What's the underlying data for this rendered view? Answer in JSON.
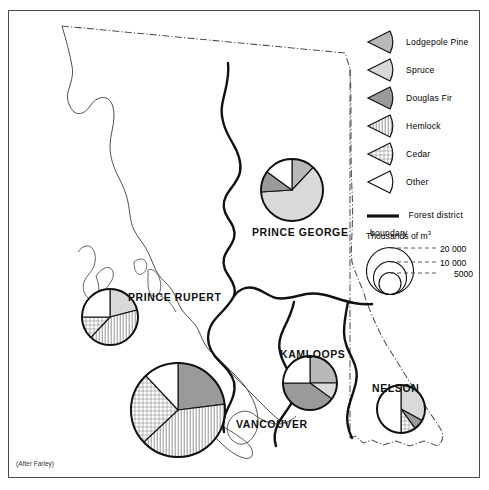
{
  "figure": {
    "credit": "(After Farley)"
  },
  "legend": {
    "species": [
      {
        "name": "Lodgepole Pine",
        "key": "lodgepole",
        "color": "#b9b9b9",
        "pattern": "solid"
      },
      {
        "name": "Spruce",
        "key": "spruce",
        "color": "#d9d9d9",
        "pattern": "solid"
      },
      {
        "name": "Douglas Fir",
        "key": "douglasfir",
        "color": "#9a9a9a",
        "pattern": "solid"
      },
      {
        "name": "Hemlock",
        "key": "hemlock",
        "color": "#ffffff",
        "pattern": "vertical-lines"
      },
      {
        "name": "Cedar",
        "key": "cedar",
        "color": "#ffffff",
        "pattern": "cross-hatch"
      },
      {
        "name": "Other",
        "key": "other",
        "color": "#ffffff",
        "pattern": "none"
      }
    ],
    "boundary_label": "Forest district boundary",
    "scale_title": "Thousands of m",
    "scale_title_sup": "3",
    "scale_values": [
      "20 000",
      "10 000",
      "5000"
    ]
  },
  "chart_data": {
    "type": "pie",
    "unit": "Thousands of m3",
    "categories": [
      "Lodgepole Pine",
      "Spruce",
      "Douglas Fir",
      "Hemlock",
      "Cedar",
      "Other"
    ],
    "districts": [
      {
        "name": "PRINCE GEORGE",
        "total": 14000,
        "radius_px": 31,
        "cx": 292,
        "cy": 190,
        "label_x": 252,
        "label_y": 226,
        "values": [
          12,
          62,
          11,
          0,
          0,
          15
        ]
      },
      {
        "name": "PRINCE RUPERT",
        "total": 9000,
        "radius_px": 28,
        "cx": 110,
        "cy": 317,
        "label_x": 128,
        "label_y": 291,
        "values": [
          0,
          21,
          0,
          41,
          13,
          25
        ]
      },
      {
        "name": "VANCOUVER",
        "total": 22000,
        "radius_px": 47,
        "cx": 178,
        "cy": 410,
        "label_x": 236,
        "label_y": 418,
        "values": [
          0,
          0,
          23,
          40,
          25,
          12
        ]
      },
      {
        "name": "KAMLOOPS",
        "total": 11000,
        "radius_px": 27,
        "cx": 310,
        "cy": 383,
        "label_x": 280,
        "label_y": 348,
        "values": [
          25,
          10,
          40,
          0,
          0,
          25
        ]
      },
      {
        "name": "NELSON",
        "total": 8500,
        "radius_px": 24,
        "cx": 401,
        "cy": 409,
        "label_x": 372,
        "label_y": 382,
        "values": [
          0,
          33,
          7,
          0,
          10,
          50
        ]
      }
    ]
  }
}
